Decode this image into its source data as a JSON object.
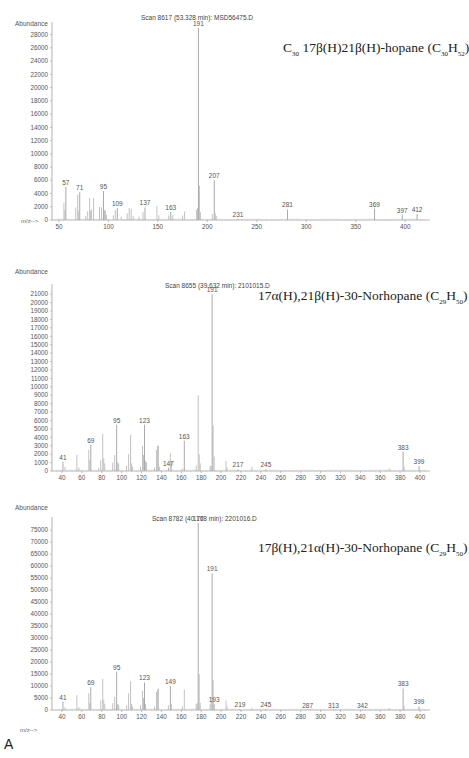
{
  "figure_label": "A",
  "chart_data": [
    {
      "type": "bar",
      "title": "Scan 8617 (53.328 min): MSD56475.D",
      "compound": {
        "prefix": "C",
        "prefix_sub": "30",
        "name": " 17β(H)21β(H)-hopane (C",
        "f1_sub": "30",
        "mid": "H",
        "f2_sub": "52",
        "suffix": ")"
      },
      "ylabel": "Abundance",
      "xlabel": "m/z-->",
      "xlim": [
        45,
        420
      ],
      "ylim": [
        0,
        29000
      ],
      "xticks": [
        50,
        100,
        150,
        200,
        250,
        300,
        350,
        400
      ],
      "yticks": [
        0,
        2000,
        4000,
        6000,
        8000,
        10000,
        12000,
        14000,
        16000,
        18000,
        20000,
        22000,
        24000,
        26000,
        28000
      ],
      "peaks_labeled": [
        {
          "mz": 57,
          "abundance": 5000
        },
        {
          "mz": 71,
          "abundance": 4200
        },
        {
          "mz": 95,
          "abundance": 4400
        },
        {
          "mz": 109,
          "abundance": 1800
        },
        {
          "mz": 137,
          "abundance": 1900
        },
        {
          "mz": 163,
          "abundance": 1200
        },
        {
          "mz": 191,
          "abundance": 29000
        },
        {
          "mz": 207,
          "abundance": 6000
        },
        {
          "mz": 231,
          "abundance": 200
        },
        {
          "mz": 281,
          "abundance": 1600
        },
        {
          "mz": 369,
          "abundance": 1700
        },
        {
          "mz": 397,
          "abundance": 800
        },
        {
          "mz": 412,
          "abundance": 900
        }
      ],
      "peaks_unlabeled": [
        {
          "mz": 55,
          "abundance": 2600
        },
        {
          "mz": 56,
          "abundance": 1500
        },
        {
          "mz": 67,
          "abundance": 1900
        },
        {
          "mz": 69,
          "abundance": 3800
        },
        {
          "mz": 69.5,
          "abundance": 1400
        },
        {
          "mz": 77,
          "abundance": 600
        },
        {
          "mz": 79,
          "abundance": 1300
        },
        {
          "mz": 81,
          "abundance": 3300
        },
        {
          "mz": 82,
          "abundance": 1400
        },
        {
          "mz": 83,
          "abundance": 1600
        },
        {
          "mz": 85,
          "abundance": 3300
        },
        {
          "mz": 91,
          "abundance": 2000
        },
        {
          "mz": 93,
          "abundance": 1900
        },
        {
          "mz": 96,
          "abundance": 1500
        },
        {
          "mz": 97,
          "abundance": 1400
        },
        {
          "mz": 98,
          "abundance": 800
        },
        {
          "mz": 105,
          "abundance": 700
        },
        {
          "mz": 107,
          "abundance": 1500
        },
        {
          "mz": 113,
          "abundance": 500
        },
        {
          "mz": 119,
          "abundance": 1000
        },
        {
          "mz": 121,
          "abundance": 1800
        },
        {
          "mz": 123,
          "abundance": 1700
        },
        {
          "mz": 125,
          "abundance": 600
        },
        {
          "mz": 131,
          "abundance": 500
        },
        {
          "mz": 135,
          "abundance": 1200
        },
        {
          "mz": 149,
          "abundance": 2100
        },
        {
          "mz": 151,
          "abundance": 700
        },
        {
          "mz": 161,
          "abundance": 700
        },
        {
          "mz": 165,
          "abundance": 700
        },
        {
          "mz": 175,
          "abundance": 700
        },
        {
          "mz": 177,
          "abundance": 1300
        },
        {
          "mz": 189,
          "abundance": 1600
        },
        {
          "mz": 190,
          "abundance": 1800
        },
        {
          "mz": 192,
          "abundance": 5200
        },
        {
          "mz": 193,
          "abundance": 1200
        },
        {
          "mz": 205,
          "abundance": 900
        },
        {
          "mz": 208,
          "abundance": 1000
        },
        {
          "mz": 209,
          "abundance": 600
        }
      ]
    },
    {
      "type": "bar",
      "title": "Scan 8655 (39.632 min): 2101015.D",
      "compound": {
        "prefix": "",
        "prefix_sub": "",
        "name": "17α(H),21β(H)-30-Norhopane (C",
        "f1_sub": "29",
        "mid": "H",
        "f2_sub": "50",
        "suffix": ")"
      },
      "ylabel": "Abundance",
      "xlabel": "m/z-->",
      "xlim": [
        32,
        405
      ],
      "ylim": [
        0,
        21500
      ],
      "xticks": [
        40,
        60,
        80,
        100,
        120,
        140,
        160,
        180,
        200,
        220,
        240,
        260,
        280,
        300,
        320,
        340,
        360,
        380,
        400
      ],
      "yticks": [
        0,
        1000,
        2000,
        3000,
        4000,
        5000,
        6000,
        7000,
        8000,
        9000,
        10000,
        11000,
        12000,
        13000,
        14000,
        15000,
        16000,
        17000,
        18000,
        19000,
        20000,
        21000
      ],
      "peaks_labeled": [
        {
          "mz": 41,
          "abundance": 1100
        },
        {
          "mz": 69,
          "abundance": 3100
        },
        {
          "mz": 95,
          "abundance": 5500
        },
        {
          "mz": 123,
          "abundance": 5500
        },
        {
          "mz": 147,
          "abundance": 400
        },
        {
          "mz": 163,
          "abundance": 3600
        },
        {
          "mz": 191,
          "abundance": 21000
        },
        {
          "mz": 217,
          "abundance": 200
        },
        {
          "mz": 245,
          "abundance": 200
        },
        {
          "mz": 383,
          "abundance": 2300
        },
        {
          "mz": 399,
          "abundance": 600
        }
      ],
      "peaks_unlabeled": [
        {
          "mz": 43,
          "abundance": 500
        },
        {
          "mz": 55,
          "abundance": 1900
        },
        {
          "mz": 57,
          "abundance": 400
        },
        {
          "mz": 67,
          "abundance": 2500
        },
        {
          "mz": 68,
          "abundance": 1300
        },
        {
          "mz": 77,
          "abundance": 400
        },
        {
          "mz": 79,
          "abundance": 1300
        },
        {
          "mz": 81,
          "abundance": 4400
        },
        {
          "mz": 82,
          "abundance": 1500
        },
        {
          "mz": 83,
          "abundance": 900
        },
        {
          "mz": 91,
          "abundance": 1000
        },
        {
          "mz": 93,
          "abundance": 1900
        },
        {
          "mz": 96,
          "abundance": 1000
        },
        {
          "mz": 97,
          "abundance": 900
        },
        {
          "mz": 105,
          "abundance": 600
        },
        {
          "mz": 107,
          "abundance": 2000
        },
        {
          "mz": 109,
          "abundance": 4300
        },
        {
          "mz": 110,
          "abundance": 900
        },
        {
          "mz": 111,
          "abundance": 500
        },
        {
          "mz": 119,
          "abundance": 500
        },
        {
          "mz": 121,
          "abundance": 3000
        },
        {
          "mz": 122,
          "abundance": 1900
        },
        {
          "mz": 124,
          "abundance": 1200
        },
        {
          "mz": 125,
          "abundance": 1000
        },
        {
          "mz": 133,
          "abundance": 400
        },
        {
          "mz": 135,
          "abundance": 2500
        },
        {
          "mz": 136,
          "abundance": 3000
        },
        {
          "mz": 137,
          "abundance": 3000
        },
        {
          "mz": 138,
          "abundance": 500
        },
        {
          "mz": 149,
          "abundance": 2100
        },
        {
          "mz": 150,
          "abundance": 1200
        },
        {
          "mz": 161,
          "abundance": 300
        },
        {
          "mz": 175,
          "abundance": 700
        },
        {
          "mz": 177,
          "abundance": 9000
        },
        {
          "mz": 178,
          "abundance": 2000
        },
        {
          "mz": 179,
          "abundance": 900
        },
        {
          "mz": 189,
          "abundance": 600
        },
        {
          "mz": 190,
          "abundance": 600
        },
        {
          "mz": 192,
          "abundance": 5400
        },
        {
          "mz": 193,
          "abundance": 1700
        },
        {
          "mz": 205,
          "abundance": 1200
        },
        {
          "mz": 206,
          "abundance": 400
        },
        {
          "mz": 231,
          "abundance": 500
        },
        {
          "mz": 369,
          "abundance": 300
        },
        {
          "mz": 384,
          "abundance": 500
        }
      ]
    },
    {
      "type": "bar",
      "title": "Scan 8782 (40.168 min): 2201016.D",
      "compound": {
        "prefix": "",
        "prefix_sub": "",
        "name": "17β(H),21α(H)-30-Norhopane (C",
        "f1_sub": "29",
        "mid": "H",
        "f2_sub": "50",
        "suffix": ")"
      },
      "ylabel": "Abundance",
      "xlabel": "m/z-->",
      "xlim": [
        32,
        405
      ],
      "ylim": [
        0,
        78000
      ],
      "xticks": [
        40,
        60,
        80,
        100,
        120,
        140,
        160,
        180,
        200,
        220,
        240,
        260,
        280,
        300,
        320,
        340,
        360,
        380,
        400
      ],
      "yticks": [
        0,
        5000,
        10000,
        15000,
        20000,
        25000,
        30000,
        35000,
        40000,
        45000,
        50000,
        55000,
        60000,
        65000,
        70000,
        75000
      ],
      "peaks_labeled": [
        {
          "mz": 41,
          "abundance": 3500
        },
        {
          "mz": 69,
          "abundance": 9500
        },
        {
          "mz": 95,
          "abundance": 16000
        },
        {
          "mz": 123,
          "abundance": 11500
        },
        {
          "mz": 149,
          "abundance": 10000
        },
        {
          "mz": 177,
          "abundance": 78000
        },
        {
          "mz": 191,
          "abundance": 57000
        },
        {
          "mz": 193,
          "abundance": 2500
        },
        {
          "mz": 219,
          "abundance": 300
        },
        {
          "mz": 245,
          "abundance": 300
        },
        {
          "mz": 287,
          "abundance": 200
        },
        {
          "mz": 313,
          "abundance": 200
        },
        {
          "mz": 342,
          "abundance": 200
        },
        {
          "mz": 383,
          "abundance": 9000
        },
        {
          "mz": 399,
          "abundance": 1500
        }
      ],
      "peaks_unlabeled": [
        {
          "mz": 43,
          "abundance": 1000
        },
        {
          "mz": 55,
          "abundance": 6200
        },
        {
          "mz": 57,
          "abundance": 1200
        },
        {
          "mz": 67,
          "abundance": 7000
        },
        {
          "mz": 68,
          "abundance": 3000
        },
        {
          "mz": 79,
          "abundance": 4000
        },
        {
          "mz": 81,
          "abundance": 13000
        },
        {
          "mz": 82,
          "abundance": 4200
        },
        {
          "mz": 83,
          "abundance": 2500
        },
        {
          "mz": 91,
          "abundance": 2800
        },
        {
          "mz": 93,
          "abundance": 5500
        },
        {
          "mz": 96,
          "abundance": 2500
        },
        {
          "mz": 97,
          "abundance": 2200
        },
        {
          "mz": 105,
          "abundance": 2000
        },
        {
          "mz": 107,
          "abundance": 7000
        },
        {
          "mz": 109,
          "abundance": 12000
        },
        {
          "mz": 110,
          "abundance": 2500
        },
        {
          "mz": 111,
          "abundance": 1500
        },
        {
          "mz": 119,
          "abundance": 2000
        },
        {
          "mz": 121,
          "abundance": 8000
        },
        {
          "mz": 122,
          "abundance": 5000
        },
        {
          "mz": 124,
          "abundance": 2500
        },
        {
          "mz": 133,
          "abundance": 1500
        },
        {
          "mz": 135,
          "abundance": 7500
        },
        {
          "mz": 136,
          "abundance": 8500
        },
        {
          "mz": 137,
          "abundance": 9000
        },
        {
          "mz": 147,
          "abundance": 2000
        },
        {
          "mz": 150,
          "abundance": 2500
        },
        {
          "mz": 161,
          "abundance": 1500
        },
        {
          "mz": 163,
          "abundance": 8500
        },
        {
          "mz": 175,
          "abundance": 2500
        },
        {
          "mz": 176,
          "abundance": 3000
        },
        {
          "mz": 178,
          "abundance": 15000
        },
        {
          "mz": 179,
          "abundance": 3000
        },
        {
          "mz": 189,
          "abundance": 2500
        },
        {
          "mz": 190,
          "abundance": 3500
        },
        {
          "mz": 192,
          "abundance": 12500
        },
        {
          "mz": 205,
          "abundance": 4000
        },
        {
          "mz": 206,
          "abundance": 1500
        },
        {
          "mz": 231,
          "abundance": 800
        },
        {
          "mz": 369,
          "abundance": 700
        },
        {
          "mz": 384,
          "abundance": 1800
        }
      ]
    }
  ]
}
